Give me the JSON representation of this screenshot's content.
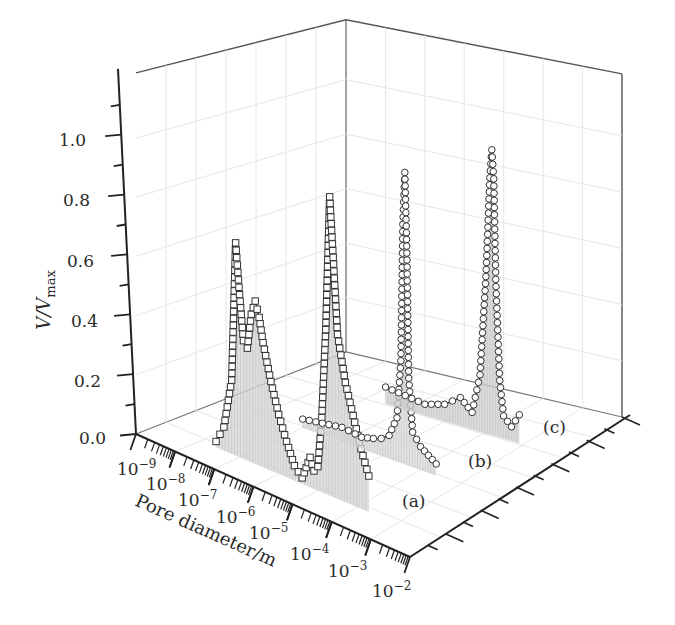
{
  "chart_data": {
    "type": "line",
    "subtype": "3d-waterfall",
    "title": "",
    "xlabel": "Pore diameter/m",
    "ylabel": "V/V_max",
    "ylabel_parts": {
      "main": "V/V",
      "subscript": "max"
    },
    "x_scale": "log",
    "x_ticks": [
      "10^-9",
      "10^-8",
      "10^-7",
      "10^-6",
      "10^-5",
      "10^-4",
      "10^-3",
      "10^-2"
    ],
    "x_tick_labels": [
      {
        "base": "10",
        "exp": "−9"
      },
      {
        "base": "10",
        "exp": "−8"
      },
      {
        "base": "10",
        "exp": "−7"
      },
      {
        "base": "10",
        "exp": "−6"
      },
      {
        "base": "10",
        "exp": "−5"
      },
      {
        "base": "10",
        "exp": "−4"
      },
      {
        "base": "10",
        "exp": "−3"
      },
      {
        "base": "10",
        "exp": "−2"
      }
    ],
    "y_ticks": [
      "0.0",
      "0.2",
      "0.4",
      "0.6",
      "0.8",
      "1.0"
    ],
    "ylim": [
      0,
      1.15
    ],
    "xlim_log10": [
      -9,
      -2
    ],
    "grid": true,
    "legend": "none (inline series labels)",
    "series": [
      {
        "name": "(a)",
        "marker": "square",
        "log10_x": [
          -7.6,
          -7.4,
          -7.2,
          -7.1,
          -7.0,
          -6.9,
          -6.8,
          -6.7,
          -6.6,
          -6.5,
          -6.4,
          -6.2,
          -6.0,
          -5.8,
          -5.6,
          -5.4,
          -5.3,
          -5.2,
          -5.1,
          -5.0,
          -4.9,
          -4.8,
          -4.7,
          -4.6,
          -4.5,
          -4.3,
          -4.1,
          -3.9,
          -3.7
        ],
        "values": [
          0.02,
          0.08,
          0.25,
          0.72,
          0.55,
          0.4,
          0.38,
          0.5,
          0.55,
          0.5,
          0.42,
          0.3,
          0.2,
          0.12,
          0.05,
          0.02,
          0.06,
          0.1,
          0.06,
          0.08,
          0.25,
          0.55,
          1.0,
          0.78,
          0.55,
          0.4,
          0.3,
          0.2,
          0.12
        ]
      },
      {
        "name": "(b)",
        "marker": "circle",
        "log10_x": [
          -7.0,
          -6.5,
          -6.0,
          -5.5,
          -5.2,
          -5.0,
          -4.8,
          -4.6,
          -4.5,
          -4.45,
          -4.4,
          -4.35,
          -4.3,
          -4.2,
          -4.0,
          -3.8,
          -3.6
        ],
        "values": [
          0.03,
          0.04,
          0.05,
          0.04,
          0.05,
          0.06,
          0.08,
          0.15,
          0.35,
          0.82,
          1.0,
          0.75,
          0.3,
          0.12,
          0.08,
          0.06,
          0.04
        ]
      },
      {
        "name": "(c)",
        "marker": "circle",
        "log10_x": [
          -6.5,
          -6.0,
          -5.5,
          -5.0,
          -4.6,
          -4.3,
          -4.1,
          -3.95,
          -3.85,
          -3.8,
          -3.75,
          -3.7,
          -3.6,
          -3.5,
          -3.3,
          -3.1
        ],
        "values": [
          0.06,
          0.05,
          0.04,
          0.06,
          0.1,
          0.06,
          0.2,
          0.55,
          0.9,
          1.0,
          0.9,
          0.55,
          0.2,
          0.08,
          0.05,
          0.1
        ]
      }
    ],
    "annotations": [
      "(a)",
      "(b)",
      "(c)"
    ]
  }
}
